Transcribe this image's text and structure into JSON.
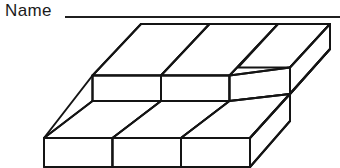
{
  "page": {
    "background_color": "#ffffff",
    "ink_color": "#141414",
    "width": 340,
    "height": 168
  },
  "header": {
    "name_label": "Name",
    "rule_line": {
      "present": true,
      "x_start": 65,
      "x_end": 340,
      "y": 17
    }
  },
  "figure": {
    "kind": "isometric-cube-block",
    "columns": 3,
    "rows": 2,
    "layers": 1,
    "total_cubes": 6,
    "line_color": "#141414",
    "fill_color": "#ffffff",
    "stroke_width": 2,
    "geometry": {
      "origin_front_left_top": [
        44,
        110
      ],
      "unit_right": [
        68.5,
        0
      ],
      "unit_depth": [
        48.5,
        -51.5
      ],
      "unit_height": [
        0,
        37
      ]
    }
  }
}
